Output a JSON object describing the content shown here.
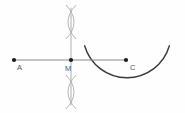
{
  "figure": {
    "background_color": "#fefefe",
    "width": 185,
    "height": 113,
    "colors": {
      "baseline": "#8a8a8a",
      "construction": "#b0b0b0",
      "main_arc": "#3a3a3a",
      "point": "#1a1a1a",
      "label": "#555555"
    },
    "points": [
      {
        "name": "A",
        "label": "A",
        "x": 14,
        "y": 60,
        "label_x": 17,
        "label_y": 70
      },
      {
        "name": "M",
        "label": "M",
        "x": 71,
        "y": 60,
        "label_x": 65,
        "label_y": 71
      },
      {
        "name": "C",
        "label": "C",
        "x": 126,
        "y": 60,
        "label_x": 130,
        "label_y": 70
      }
    ],
    "segments": [
      {
        "name": "baseline-segment-AC",
        "description": "Horizontal line through A, M and C",
        "x1": 14,
        "y1": 60,
        "x2": 126,
        "y2": 60,
        "color": "#8a8a8a",
        "width": 1.1
      },
      {
        "name": "perpendicular-bisector-at-M",
        "description": "Vertical construction line through M",
        "x1": 71,
        "y1": 8,
        "x2": 71,
        "y2": 105,
        "color": "#b0b0b0",
        "width": 1.0
      }
    ],
    "construction_crosses": [
      {
        "name": "upper-arc-intersection",
        "center_x": 71,
        "center_y": 22,
        "color": "#b0b0b0"
      },
      {
        "name": "lower-arc-intersection",
        "center_x": 71,
        "center_y": 92,
        "color": "#b0b0b0"
      }
    ],
    "main_arc": {
      "name": "circle-arc-centered-at-C",
      "center_x": 127,
      "center_y": 58,
      "radius": 44,
      "start_angle_deg": 196,
      "end_angle_deg": 344,
      "color": "#3a3a3a",
      "width": 1.5,
      "description": "Large arc of circle centered at C passing above the baseline"
    }
  }
}
